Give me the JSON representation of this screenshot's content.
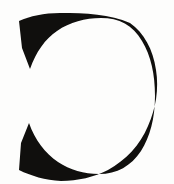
{
  "image": {
    "kind": "glyph-specimen",
    "character": "C",
    "character_name": "latin-capital-letter-c",
    "description": "Large black serif capital letter C on a plain off-white background",
    "width": 174,
    "height": 184
  },
  "colors": {
    "background": "#fdfdfc",
    "ink": "#100f0d",
    "counter": "#ffffff"
  },
  "glyph": {
    "label": "C",
    "style": "serif",
    "weight": "bold",
    "ink_color": "#100f0d",
    "bounds": {
      "left": 18,
      "top": 13,
      "right": 155,
      "bottom": 181
    },
    "strokes": {
      "top_arc_thickness": 13,
      "bottom_arc_thickness": 14,
      "bowl_thickness": 36
    },
    "terminals": {
      "upper_left": "angled-wedge-spur",
      "lower_left": "angled-wedge-spur"
    },
    "aperture": {
      "side": "left",
      "open_from_y": 70,
      "open_to_y": 135
    },
    "path": "M 60 13 C 44 13 30 16 19 21 L 22 48 L 30 69 C 36 52 45 39 57 31 C 70 22 85 18 101 18 C 119 18 133 25 142 41 C 151 56 155 74 155 96 C 155 118 150 137 141 151 C 131 166 117 174 99 174 C 84 174 70 170 58 162 C 45 153 35 140 29 123 L 21 143 L 19 170 C 31 176 45 180 61 181 C 78 181 94 177 108 170 C 126 160 140 145 148 126 C 156 108 159 89 156 70 C 153 49 144 33 130 23 C 110 14 86 13 60 13 Z"
  }
}
